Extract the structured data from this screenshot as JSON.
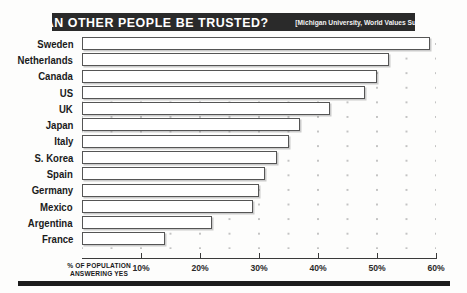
{
  "header": {
    "title": "CAN OTHER PEOPLE BE TRUSTED?",
    "source": "[Michigan University, World Values Survey]"
  },
  "axis": {
    "caption_line1": "% OF POPULATION",
    "caption_line2": "ANSWERING YES",
    "ticks": [
      "10%",
      "20%",
      "30%",
      "40%",
      "50%",
      "60%"
    ]
  },
  "chart_data": {
    "type": "bar",
    "orientation": "horizontal",
    "title": "CAN OTHER PEOPLE BE TRUSTED?",
    "subtitle": "[Michigan University, World Values Survey]",
    "xlabel": "% OF POPULATION ANSWERING YES",
    "ylabel": "",
    "xlim": [
      0,
      60
    ],
    "xticks": [
      10,
      20,
      30,
      40,
      50,
      60
    ],
    "xticklabels": [
      "10%",
      "20%",
      "30%",
      "40%",
      "50%",
      "60%"
    ],
    "grid": "dotted",
    "legend": "none",
    "categories": [
      "Sweden",
      "Netherlands",
      "Canada",
      "US",
      "UK",
      "Japan",
      "Italy",
      "S. Korea",
      "Spain",
      "Germany",
      "Mexico",
      "Argentina",
      "France"
    ],
    "values": [
      59,
      52,
      50,
      48,
      42,
      37,
      35,
      33,
      31,
      30,
      29,
      22,
      14
    ]
  }
}
